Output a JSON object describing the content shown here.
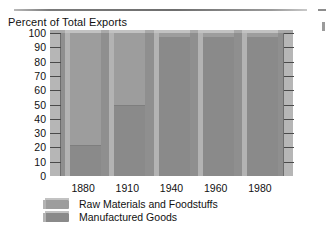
{
  "chart_data": {
    "type": "bar",
    "subtype": "stacked-percent",
    "title": "Percent of Total Exports",
    "xlabel": "",
    "ylabel": "Percent of Total Exports",
    "ylim": [
      0,
      100
    ],
    "ytick_step": 10,
    "grid": false,
    "legend_position": "bottom-left",
    "categories": [
      "1880",
      "1910",
      "1940",
      "1960",
      "1980"
    ],
    "ytick_labels": [
      "100",
      "90",
      "80",
      "70",
      "60",
      "50",
      "40",
      "30",
      "20",
      "10",
      "0"
    ],
    "series": [
      {
        "name": "Raw Materials and Foodstuffs",
        "color": "#9d9d9d",
        "values": [
          79,
          51,
          3,
          3,
          3
        ]
      },
      {
        "name": "Manufactured Goods",
        "color": "#8a8a8a",
        "values": [
          21,
          49,
          97,
          97,
          97
        ]
      }
    ]
  },
  "title": {
    "text": "Percent of Total Exports"
  },
  "axes": {
    "y_ticks": [
      {
        "label": "100",
        "value": 100
      },
      {
        "label": "90",
        "value": 90
      },
      {
        "label": "80",
        "value": 80
      },
      {
        "label": "70",
        "value": 70
      },
      {
        "label": "60",
        "value": 60
      },
      {
        "label": "50",
        "value": 50
      },
      {
        "label": "40",
        "value": 40
      },
      {
        "label": "30",
        "value": 30
      },
      {
        "label": "20",
        "value": 20
      },
      {
        "label": "10",
        "value": 10
      },
      {
        "label": "0",
        "value": 0
      }
    ],
    "x_ticks": [
      {
        "label": "1880"
      },
      {
        "label": "1910"
      },
      {
        "label": "1940"
      },
      {
        "label": "1960"
      },
      {
        "label": "1980"
      }
    ]
  },
  "bars": [
    {
      "year": "1880",
      "raw": 79,
      "manufactured": 21
    },
    {
      "year": "1910",
      "raw": 51,
      "manufactured": 49
    },
    {
      "year": "1940",
      "raw": 3,
      "manufactured": 97
    },
    {
      "year": "1960",
      "raw": 3,
      "manufactured": 97
    },
    {
      "year": "1980",
      "raw": 3,
      "manufactured": 97
    }
  ],
  "legend": {
    "items": [
      {
        "label": "Raw Materials and Foodstuffs",
        "color": "#9d9d9d"
      },
      {
        "label": "Manufactured Goods",
        "color": "#8a8a8a"
      }
    ]
  },
  "colors": {
    "raw_materials": "#9d9d9d",
    "manufactured_goods": "#8a8a8a",
    "backdrop": "#8f8f8f",
    "tick_strip": "#b6b6b6",
    "text": "#111111"
  }
}
